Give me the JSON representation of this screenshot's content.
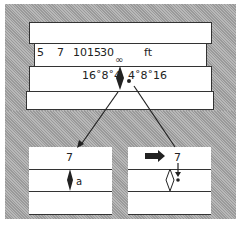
{
  "diagram": {
    "title": "",
    "main": {
      "distance_scale": [
        "5",
        "7",
        "10",
        "15",
        "30"
      ],
      "unit": "ft",
      "infinity_symbol": "∞",
      "dof_left": "16˚8˚4",
      "dof_right": "4˚8˚16"
    },
    "detail_left": {
      "distance": "7",
      "mark": "a"
    },
    "detail_right": {
      "distance": "7"
    }
  }
}
